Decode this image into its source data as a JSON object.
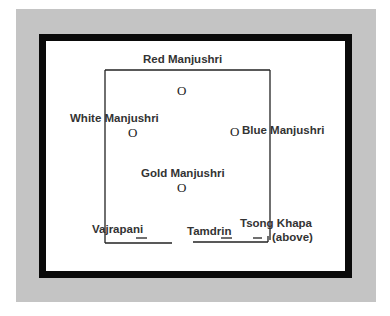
{
  "diagram": {
    "title": "Red Manjushri",
    "labels": {
      "red": "Red Manjushri",
      "white": "White Manjushri",
      "blue": "Blue Manjushri",
      "gold": "Gold Manjushri",
      "vajrapani": "Vajrapani",
      "tamdrin": "Tamdrin",
      "tsong_khapa_1": "Tsong Khapa",
      "tsong_khapa_2": "(above)"
    },
    "marker_glyph": "O",
    "dash_glyph": "—"
  }
}
